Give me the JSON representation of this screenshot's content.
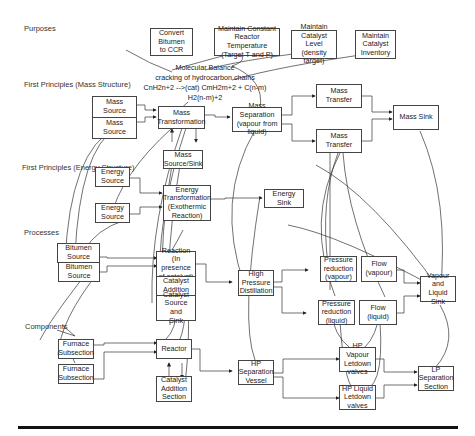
{
  "levels": {
    "purpose": "Purposes",
    "mass": "First Principles (Mass Structure)",
    "energy": "First Principles (Energy Structure)",
    "processes": "Processes",
    "components": "Components"
  },
  "purposes": {
    "p1": "Convert\nBitumen\nto CCR",
    "p2": "Maintain Constant\nReactor Temperature\n(Target T and P)",
    "p3": "Maintain\nCatalyst Level\n(density target)",
    "p4": "Maintain\nCatalyst\nInventory"
  },
  "annotation": {
    "line1": "Molecular Balance",
    "line2": "cracking of hydrocarbon chains",
    "line3": "CnH2n+2 -->(cat) CmH2m+2 + C(n-m)",
    "line4": "H2(n-m)+2"
  },
  "mass": {
    "source1": "Mass\nSource",
    "source2": "Mass\nSource",
    "transformation": "Mass\nTransformation",
    "source_sink": "Mass\nSource/Sink",
    "separation": "Mass Separation\n(vapour from\nliquid)",
    "transfer1": "Mass Transfer",
    "transfer2": "Mass Transfer",
    "sink": "Mass Sink"
  },
  "energy": {
    "source1": "Energy\nSource",
    "source2": "Energy\nSource",
    "transformation": "Energy\nTransformation\n(Exothermic\nReaction)",
    "sink": "Energy Sink"
  },
  "processes": {
    "bitumen1": "Bitumen\nSource",
    "bitumen2": "Bitumen\nSource",
    "reaction": "Reaction\n(In presence\nof catalyst)",
    "catalyst_addition": "Catalyst\nAddition",
    "catalyst_source_sink": "Catalyst\nSource and\nSink",
    "hp_distillation": "High\nPressure\nDistillation",
    "pr_vapour": "Pressure\nreduction\n(vapour)",
    "pr_liquid": "Pressure\nreduction\n(liquid)",
    "flow_vapour": "Flow\n(vapour)",
    "flow_liquid": "Flow (liquid)",
    "vl_sink": "Vapour and\nLiquid Sink"
  },
  "components": {
    "furnace1": "Furnace\nSubsection",
    "furnace2": "Furnace\nSubsection",
    "reactor": "Reactor",
    "catalyst_addition_section": "Catalyst\nAddition\nSection",
    "hp_sep_vessel": "HP\nSeparation\nVessel",
    "hp_vapour_valves": "HP Vapour\nLetdown\nvalves",
    "hp_liquid_valves": "HP Liquid\nLetdown\nvalves",
    "lp_sep_section": "LP\nSeparation\nSection"
  },
  "colors": {
    "line": "#333333",
    "box_border": "#444444",
    "rule": "#111111"
  }
}
